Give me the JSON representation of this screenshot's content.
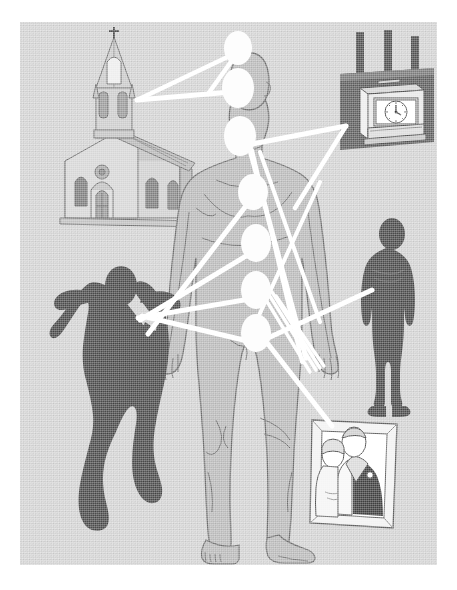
{
  "meta": {
    "canvas": {
      "width": 457,
      "height": 590
    },
    "panel": {
      "x": 20,
      "y": 22,
      "width": 417,
      "height": 543
    }
  },
  "colors": {
    "page_background": "#ffffff",
    "panel_background": "#d2d2d2",
    "body_fill": "#b9b9b9",
    "body_fill_shadow": "#aaaaaa",
    "body_outline": "#6a6a6a",
    "silhouette_dark": "#4a4a4a",
    "beam_white": "#ffffff",
    "chakra_white": "#fdfdfd",
    "object_light": "#e8e8e8",
    "object_mid": "#c5c5c5",
    "object_dark": "#6d6d6d",
    "clock_wall_dark": "#5a5a5a",
    "line_dark": "#555555"
  },
  "central_figure": {
    "name": "human-body-figure",
    "description": "Front-facing nude human body outline, light grey fill with darker contour lines",
    "pose": "standing, arms at sides, feet apart"
  },
  "chakra_points": [
    {
      "id": "crown",
      "label": "Crown",
      "cx": 238,
      "cy": 48,
      "rx": 14,
      "ry": 17
    },
    {
      "id": "third-eye",
      "label": "Third Eye",
      "cx": 238,
      "cy": 88,
      "rx": 16,
      "ry": 20
    },
    {
      "id": "throat",
      "label": "Throat",
      "cx": 240,
      "cy": 136,
      "rx": 16,
      "ry": 20
    },
    {
      "id": "heart",
      "label": "Heart",
      "cx": 253,
      "cy": 192,
      "rx": 15,
      "ry": 18
    },
    {
      "id": "solar-plexus",
      "label": "Solar Plexus",
      "cx": 256,
      "cy": 243,
      "rx": 15,
      "ry": 19
    },
    {
      "id": "sacral",
      "label": "Sacral",
      "cx": 256,
      "cy": 290,
      "rx": 15,
      "ry": 19
    },
    {
      "id": "root",
      "label": "Root",
      "cx": 256,
      "cy": 333,
      "rx": 15,
      "ry": 19
    }
  ],
  "symbols": [
    {
      "id": "church",
      "name": "church-illustration",
      "label": "Church",
      "description": "Line-drawn church with tall steeple, cross on top, arched windows and double doors",
      "position": {
        "x": 64,
        "y": 28,
        "width": 118,
        "height": 180
      }
    },
    {
      "id": "time-clock",
      "name": "time-clock-illustration",
      "label": "Time clock",
      "description": "Wall-mounted punch time clock with analogue dial on a dark panel with three pipes",
      "position": {
        "x": 326,
        "y": 36,
        "width": 114,
        "height": 124
      }
    },
    {
      "id": "female-silhouette",
      "name": "female-nude-silhouette",
      "label": "Female figure",
      "description": "Dark silhouette of a nude woman standing with hands behind her head",
      "position": {
        "x": 26,
        "y": 253,
        "width": 130,
        "height": 255
      }
    },
    {
      "id": "male-silhouette",
      "name": "male-silhouette",
      "label": "Male figure",
      "description": "Dark silhouette of a standing man seen from behind",
      "position": {
        "x": 352,
        "y": 200,
        "width": 82,
        "height": 160
      }
    },
    {
      "id": "wedding-photo",
      "name": "framed-wedding-photo",
      "label": "Wedding photograph",
      "description": "Framed photograph of a bride and groom in a white picture frame",
      "position": {
        "x": 311,
        "y": 420,
        "width": 86,
        "height": 106
      }
    }
  ],
  "beams": [
    {
      "id": "beam-church-thirdeye",
      "from": "church",
      "to": "third-eye",
      "x1": 137,
      "y1": 98,
      "x2": 228,
      "y2": 88,
      "width": 5
    },
    {
      "id": "beam-crown-church",
      "from": "crown",
      "to": "church",
      "x1": 233,
      "y1": 50,
      "x2": 137,
      "y2": 98,
      "width": 4
    },
    {
      "id": "beam-crown-face",
      "from": "crown",
      "to": "face",
      "x1": 236,
      "y1": 50,
      "x2": 208,
      "y2": 88,
      "width": 4
    },
    {
      "id": "beam-clock-throat",
      "from": "time-clock",
      "to": "throat",
      "x1": 346,
      "y1": 120,
      "x2": 250,
      "y2": 141,
      "width": 5
    },
    {
      "id": "beam-clock-shoulder",
      "from": "time-clock",
      "to": "right-torso",
      "x1": 346,
      "y1": 120,
      "x2": 292,
      "y2": 200,
      "width": 4
    },
    {
      "id": "beam-throat-lowright",
      "from": "throat",
      "to": "lower-right",
      "x1": 250,
      "y1": 145,
      "x2": 300,
      "y2": 352,
      "width": 5
    },
    {
      "id": "beam-throat-cross",
      "from": "throat",
      "to": "right-hip",
      "x1": 252,
      "y1": 146,
      "x2": 296,
      "y2": 345,
      "width": 4
    },
    {
      "id": "beam-heart-leftknee",
      "from": "heart",
      "to": "lower-left",
      "x1": 247,
      "y1": 198,
      "x2": 152,
      "y2": 330,
      "width": 5
    },
    {
      "id": "beam-solar-left",
      "from": "solar-plexus",
      "to": "left-field",
      "x1": 248,
      "y1": 248,
      "x2": 140,
      "y2": 312,
      "width": 5
    },
    {
      "id": "beam-sacral-female",
      "from": "sacral",
      "to": "female-silhouette",
      "x1": 247,
      "y1": 292,
      "x2": 112,
      "y2": 370,
      "width": 5
    },
    {
      "id": "beam-root-male",
      "from": "root",
      "to": "male-silhouette",
      "x1": 266,
      "y1": 330,
      "x2": 368,
      "y2": 288,
      "width": 5
    },
    {
      "id": "beam-root-photo",
      "from": "root",
      "to": "wedding-photo",
      "x1": 268,
      "y1": 340,
      "x2": 330,
      "y2": 424,
      "width": 5
    },
    {
      "id": "beam-fan-1",
      "from": "pelvic-fan",
      "to": "lower-right",
      "x1": 262,
      "y1": 300,
      "x2": 300,
      "y2": 360,
      "width": 3
    },
    {
      "id": "beam-fan-2",
      "from": "pelvic-fan",
      "to": "lower-right",
      "x1": 264,
      "y1": 304,
      "x2": 296,
      "y2": 362,
      "width": 3
    }
  ]
}
